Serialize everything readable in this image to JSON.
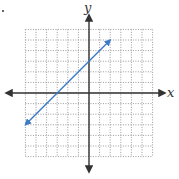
{
  "chart_data": {
    "type": "line",
    "title": "",
    "xlabel": "x",
    "ylabel": "y",
    "xlim": [
      -6,
      6
    ],
    "ylim": [
      -6,
      6
    ],
    "grid": true,
    "grid_style": "dotted",
    "legend": null,
    "axes_arrows": true,
    "series": [
      {
        "name": "y = x + 3",
        "equation": "y = x + 3",
        "color": "#3b7bc8",
        "arrows_both_ends": true,
        "x": [
          -6,
          2
        ],
        "y": [
          -3,
          5
        ],
        "x_intercept": -3,
        "y_intercept": 3
      }
    ]
  },
  "labels": {
    "x_axis": "x",
    "y_axis": "y"
  },
  "colors": {
    "axis": "#333333",
    "grid": "#9a9a9a",
    "line": "#3b7bc8"
  }
}
